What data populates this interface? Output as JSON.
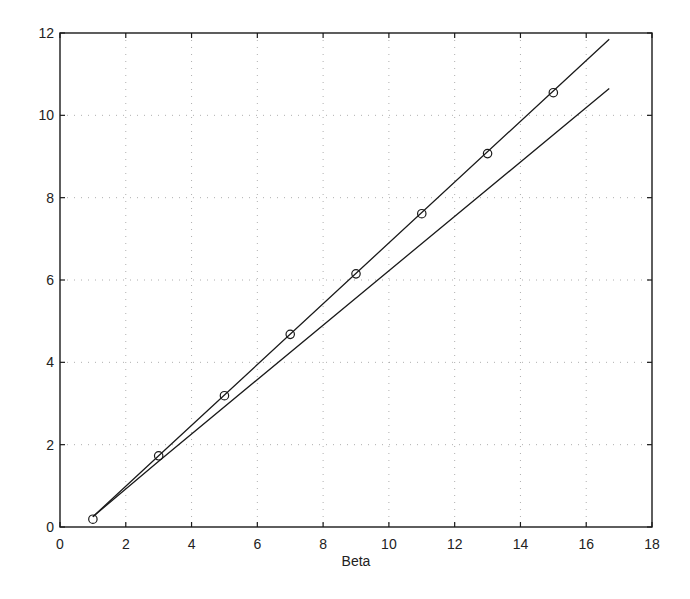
{
  "chart_data": {
    "type": "line",
    "title": "",
    "xlabel": "Beta",
    "ylabel": "",
    "xlim": [
      0,
      18
    ],
    "ylim": [
      0,
      12
    ],
    "xticks": [
      0,
      2,
      4,
      6,
      8,
      10,
      12,
      14,
      16,
      18
    ],
    "yticks": [
      0,
      2,
      4,
      6,
      8,
      10,
      12
    ],
    "grid": true,
    "grid_style": "dotted",
    "legend": null,
    "series": [
      {
        "name": "series-with-markers",
        "marker": "circle",
        "points": [
          {
            "x": 1,
            "y": 0.19
          },
          {
            "x": 3,
            "y": 1.73
          },
          {
            "x": 5,
            "y": 3.19
          },
          {
            "x": 7,
            "y": 4.68
          },
          {
            "x": 9,
            "y": 6.15
          },
          {
            "x": 11,
            "y": 7.61
          },
          {
            "x": 13,
            "y": 9.07
          },
          {
            "x": 15,
            "y": 10.55
          }
        ],
        "line": [
          {
            "x": 1,
            "y": 0.25
          },
          {
            "x": 3,
            "y": 1.73
          },
          {
            "x": 16.7,
            "y": 11.85
          }
        ]
      },
      {
        "name": "series-line-only",
        "marker": "none",
        "line": [
          {
            "x": 1,
            "y": 0.25
          },
          {
            "x": 3,
            "y": 1.6
          },
          {
            "x": 16.7,
            "y": 10.65
          }
        ]
      }
    ]
  },
  "colors": {
    "line": "#1a1a1a",
    "axis": "#1a1a1a",
    "grid": "#9a9a9a",
    "background": "#ffffff"
  },
  "layout": {
    "plot_left": 60,
    "plot_top": 33,
    "plot_right": 652,
    "plot_bottom": 527
  }
}
